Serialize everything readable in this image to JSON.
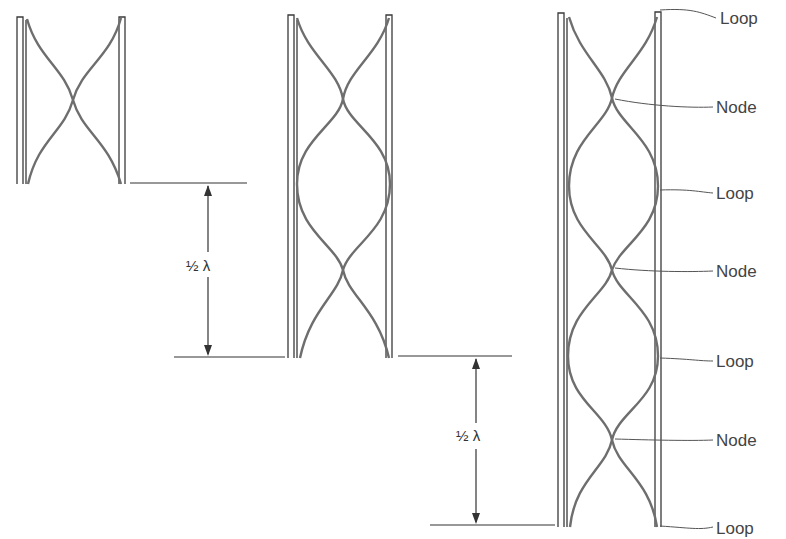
{
  "diagram": {
    "type": "standing-waves-in-tubes",
    "tubes": [
      {
        "name": "tube-1",
        "length": "1/2 wavelength",
        "nodes": 1,
        "loops": 2
      },
      {
        "name": "tube-2",
        "length": "1 wavelength",
        "nodes": 2,
        "loops": 3
      },
      {
        "name": "tube-3",
        "length": "3/2 wavelength",
        "nodes": 3,
        "loops": 4
      }
    ],
    "dimensions": [
      {
        "label": "½ λ",
        "from": "tube-1 bottom",
        "to": "tube-2 bottom"
      },
      {
        "label": "½ λ",
        "from": "tube-2 bottom",
        "to": "tube-3 bottom"
      }
    ],
    "annotations": [
      "Loop",
      "Node",
      "Loop",
      "Node",
      "Loop",
      "Node",
      "Loop"
    ]
  },
  "labels": {
    "dim1": "½ λ",
    "dim2": "½ λ",
    "a0": "Loop",
    "a1": "Node",
    "a2": "Loop",
    "a3": "Node",
    "a4": "Loop",
    "a5": "Node",
    "a6": "Loop"
  },
  "colors": {
    "tube": "#3a3a3a",
    "wave": "#6e6e6e",
    "text": "#444444"
  }
}
